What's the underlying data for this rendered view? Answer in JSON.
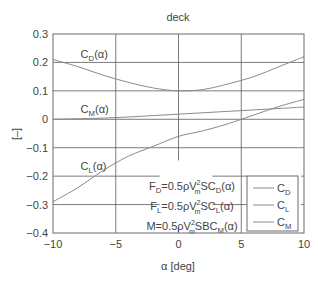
{
  "chart_data": {
    "type": "line",
    "title": "deck",
    "xlabel": "α [deg]",
    "ylabel": "[–]",
    "xlim": [
      -10,
      10
    ],
    "ylim": [
      -0.4,
      0.3
    ],
    "xticks": [
      -10,
      -5,
      0,
      5,
      10
    ],
    "xtick_labels": [
      "−10",
      "−5",
      "0",
      "5",
      "10"
    ],
    "yticks": [
      -0.4,
      -0.3,
      -0.2,
      -0.1,
      0,
      0.1,
      0.2,
      0.3
    ],
    "ytick_labels": [
      "−0.4",
      "−0.3",
      "−0.2",
      "−0.1",
      "0",
      "0.1",
      "0.2",
      "0.3"
    ],
    "grid": true,
    "legend_position": "lower right",
    "x": [
      -10,
      -8,
      -6,
      -4,
      -2,
      0,
      2,
      4,
      6,
      8,
      10
    ],
    "series": [
      {
        "name": "C_D",
        "label_main": "C",
        "label_sub": "D",
        "values": [
          0.21,
          0.185,
          0.155,
          0.13,
          0.11,
          0.1,
          0.105,
          0.125,
          0.15,
          0.185,
          0.22
        ]
      },
      {
        "name": "C_L",
        "label_main": "C",
        "label_sub": "L",
        "values": [
          -0.29,
          -0.24,
          -0.18,
          -0.13,
          -0.095,
          -0.06,
          -0.04,
          -0.015,
          0.015,
          0.045,
          0.07
        ]
      },
      {
        "name": "C_M",
        "label_main": "C",
        "label_sub": "M",
        "values": [
          0.0,
          0.002,
          0.004,
          0.008,
          0.013,
          0.018,
          0.023,
          0.028,
          0.033,
          0.038,
          0.043
        ]
      }
    ],
    "annotations": [
      {
        "id": "cd-label",
        "main": "C",
        "sub": "D",
        "suffix": "(α)",
        "x": -7.8,
        "y": 0.23
      },
      {
        "id": "cm-label",
        "main": "C",
        "sub": "M",
        "suffix": "(α)",
        "x": -7.8,
        "y": 0.035
      },
      {
        "id": "cl-label",
        "main": "C",
        "sub": "L",
        "suffix": "(α)",
        "x": -7.8,
        "y": -0.165
      }
    ],
    "formulas": [
      {
        "lhs": "F",
        "lhs_sub": "D",
        "mid": "=0.5ρV",
        "sup": "2",
        "sub": "m",
        "rest": "SC",
        "coef_sub": "D",
        "tail": "(α)"
      },
      {
        "lhs": "F",
        "lhs_sub": "L",
        "mid": "=0.5ρV",
        "sup": "2",
        "sub": "m",
        "rest": "SC",
        "coef_sub": "L",
        "tail": "(α)"
      },
      {
        "lhs": "M",
        "lhs_sub": "",
        "mid": "=0.5ρV",
        "sup": "2",
        "sub": "m",
        "rest": "SBC",
        "coef_sub": "M",
        "tail": "(α)"
      }
    ]
  },
  "colors": {
    "line": "#8a8a8a",
    "grid": "#5a5a5a",
    "frame": "#6a6a6a",
    "text": "#444444"
  }
}
